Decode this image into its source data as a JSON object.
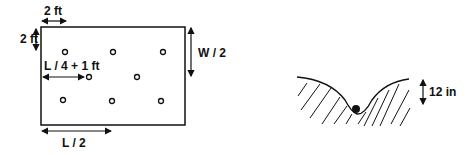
{
  "diagram": {
    "left_panel": {
      "title": "sampling-grid-plan",
      "labels": {
        "top_offset": "2 ft",
        "side_offset": "2 ft",
        "middle_offset": "L / 4 + 1 ft",
        "width_half": "W / 2",
        "length_half": "L / 2"
      },
      "rows": [
        {
          "name": "row-1",
          "points": 3
        },
        {
          "name": "row-2",
          "points": 2
        },
        {
          "name": "row-3",
          "points": 3
        }
      ]
    },
    "right_panel": {
      "title": "furrow-cross-section",
      "labels": {
        "depth": "12 in"
      }
    },
    "colors": {
      "line": "#111111",
      "background": "#ffffff"
    }
  }
}
